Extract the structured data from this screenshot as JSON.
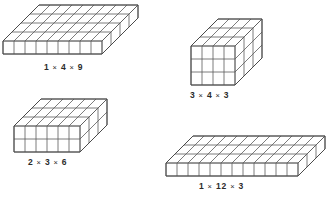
{
  "figure": {
    "background_color": "#ffffff",
    "line_color": "#5a5a5a",
    "label_color": "#2b2b2b",
    "projection": {
      "cell_width": 11,
      "cell_height": 13,
      "depth_dx": 9,
      "depth_dy": -9
    },
    "blocks": [
      {
        "id": "block-1x4x9",
        "label": "1 X 4 X 9",
        "height": 1,
        "depth": 4,
        "width": 9,
        "origin_x": 3,
        "origin_y": 54,
        "label_x": 44,
        "label_y": 62
      },
      {
        "id": "block-3x4x3",
        "label": "3 X 4 X 3",
        "height": 3,
        "depth": 3,
        "width": 4,
        "origin_x": 191,
        "origin_y": 85,
        "label_x": 190,
        "label_y": 90
      },
      {
        "id": "block-2x3x6",
        "label": "2 X 3 X 6",
        "height": 2,
        "depth": 3,
        "width": 6,
        "origin_x": 14,
        "origin_y": 152,
        "label_x": 28,
        "label_y": 157
      },
      {
        "id": "block-1x12x3",
        "label": "1 X 12 X 3",
        "height": 1,
        "depth": 3,
        "width": 12,
        "origin_x": 166,
        "origin_y": 176,
        "label_x": 199,
        "label_y": 181
      }
    ]
  }
}
